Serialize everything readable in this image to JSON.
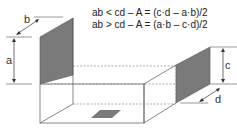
{
  "formulas": [
    "ab < cd – A = (c·d – a·b)/2",
    "ab > cd – A = (a·b – c·d)/2"
  ],
  "labels": {
    "a": "a",
    "b": "b",
    "c": "c",
    "d": "d"
  },
  "colors": {
    "shade": "#7a7a7a",
    "line": "#555555"
  }
}
